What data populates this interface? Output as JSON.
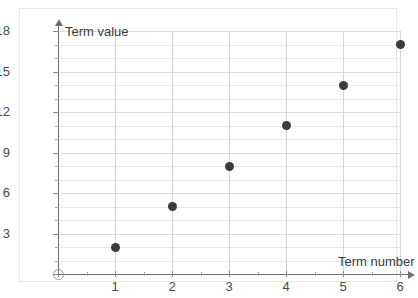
{
  "chart_data": {
    "type": "scatter",
    "title": "",
    "xlabel": "Term number",
    "ylabel": "Term value",
    "x": [
      1,
      2,
      3,
      4,
      5,
      6
    ],
    "values": [
      2,
      5,
      8,
      11,
      14,
      17
    ],
    "points": [
      {
        "x": 1,
        "y": 2
      },
      {
        "x": 2,
        "y": 5
      },
      {
        "x": 3,
        "y": 8
      },
      {
        "x": 4,
        "y": 11
      },
      {
        "x": 5,
        "y": 14
      },
      {
        "x": 6,
        "y": 17
      }
    ],
    "xlim": [
      0,
      6
    ],
    "ylim": [
      0,
      18
    ],
    "x_ticks": [
      0,
      1,
      2,
      3,
      4,
      5,
      6
    ],
    "x_tick_labels": [
      "0",
      "1",
      "2",
      "3",
      "4",
      "5",
      "6"
    ],
    "y_ticks": [
      0,
      3,
      6,
      9,
      12,
      15,
      18
    ],
    "y_tick_labels": [
      "0",
      "3",
      "6",
      "9",
      "12",
      "15",
      "18"
    ],
    "y_minor_step": 1,
    "grid": true,
    "legend": false,
    "point_color": "#3b3b3b",
    "axis_color": "#6f6f6f",
    "gridline_color": "#dcdcdc",
    "origin_label": "0"
  },
  "axis_titles": {
    "y": "Term value",
    "x": "Term number"
  }
}
